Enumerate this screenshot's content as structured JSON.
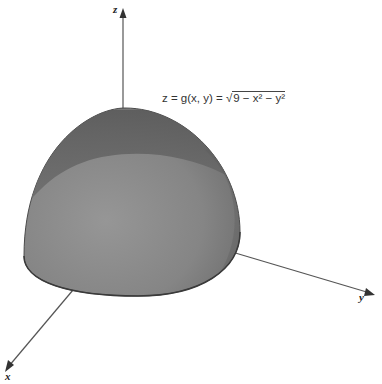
{
  "figure": {
    "type": "3d-surface-plot",
    "surface": "upper hemisphere",
    "equation": {
      "lhs": "z = g(x, y) = ",
      "radicand": "9 − x² − y²",
      "full": "z = g(x, y) = √(9 − x² − y²)"
    },
    "axes": {
      "z": "z",
      "x": "x",
      "y": "y"
    },
    "colors": {
      "surface_light": "#8a8a8a",
      "surface_dark": "#5e5e5e",
      "axis": "#555555",
      "background": "#ffffff"
    }
  }
}
